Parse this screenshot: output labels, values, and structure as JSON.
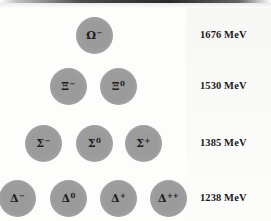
{
  "figure": {
    "background_color": "#fdfdfc",
    "circle_color": "#9b9b9b",
    "text_color": "#1a1a1a"
  },
  "chart_data": {
    "type": "scatter",
    "title": "",
    "subtitle": "",
    "xlabel": "",
    "ylabel": "",
    "grid": false,
    "legend_position": "none",
    "rows": [
      {
        "row_index": 0,
        "energy_label": "1676 MeV",
        "energy_value": 1676,
        "energy_unit": "MeV",
        "particles": [
          {
            "symbol": "Ω",
            "charge": "−",
            "name": "omega-minus",
            "x": 94,
            "y": 35
          }
        ]
      },
      {
        "row_index": 1,
        "energy_label": "1530 MeV",
        "energy_value": 1530,
        "energy_unit": "MeV",
        "particles": [
          {
            "symbol": "Ξ",
            "charge": "−",
            "name": "xi-minus",
            "x": 68,
            "y": 86
          },
          {
            "symbol": "Ξ",
            "charge": "0",
            "name": "xi-zero",
            "x": 118,
            "y": 86
          }
        ]
      },
      {
        "row_index": 2,
        "energy_label": "1385 MeV",
        "energy_value": 1385,
        "energy_unit": "MeV",
        "particles": [
          {
            "symbol": "Σ",
            "charge": "−",
            "name": "sigma-minus",
            "x": 43,
            "y": 143
          },
          {
            "symbol": "Σ",
            "charge": "0",
            "name": "sigma-zero",
            "x": 94,
            "y": 143
          },
          {
            "symbol": "Σ",
            "charge": "+",
            "name": "sigma-plus",
            "x": 143,
            "y": 143
          }
        ]
      },
      {
        "row_index": 3,
        "energy_label": "1238 MeV",
        "energy_value": 1238,
        "energy_unit": "MeV",
        "particles": [
          {
            "symbol": "Δ",
            "charge": "−",
            "name": "delta-minus",
            "x": 17,
            "y": 198
          },
          {
            "symbol": "Δ",
            "charge": "0",
            "name": "delta-zero",
            "x": 68,
            "y": 198
          },
          {
            "symbol": "Δ",
            "charge": "+",
            "name": "delta-plus",
            "x": 118,
            "y": 198
          },
          {
            "symbol": "Δ",
            "charge": "++",
            "name": "delta-plus-plus",
            "x": 168,
            "y": 198
          }
        ]
      }
    ],
    "energy_label_x": 200,
    "circle_diameter": 37
  }
}
